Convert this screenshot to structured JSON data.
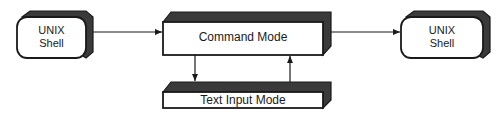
{
  "diagram": {
    "colors": {
      "line": "#1a1a1a",
      "shade": "#3a3a3a",
      "face": "#ffffff"
    },
    "nodes": [
      {
        "id": "left-shell",
        "label_line1": "UNIX",
        "label_line2": "Shell"
      },
      {
        "id": "command-mode",
        "label": "Command Mode"
      },
      {
        "id": "right-shell",
        "label_line1": "UNIX",
        "label_line2": "Shell"
      },
      {
        "id": "text-input-mode",
        "label": "Text Input Mode"
      }
    ],
    "edges": [
      {
        "from": "left-shell",
        "to": "command-mode"
      },
      {
        "from": "command-mode",
        "to": "right-shell"
      },
      {
        "from": "command-mode",
        "to": "text-input-mode"
      },
      {
        "from": "text-input-mode",
        "to": "command-mode"
      }
    ]
  }
}
